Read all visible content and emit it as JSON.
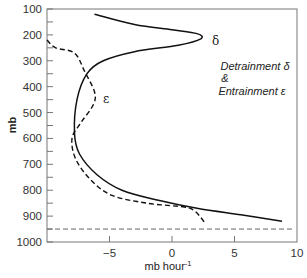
{
  "chart_data": {
    "type": "line",
    "title": "",
    "xlabel": "mb hour",
    "xlabel_superscript": "-1",
    "ylabel": "mb",
    "xlim": [
      -10,
      10
    ],
    "ylim": [
      1000,
      100
    ],
    "y_inverted": true,
    "xticks": [
      -5,
      0,
      5,
      10
    ],
    "xtick_labels": [
      "−5",
      "0",
      "5",
      "10"
    ],
    "yticks": [
      100,
      200,
      300,
      400,
      500,
      600,
      700,
      800,
      900,
      1000
    ],
    "ytick_labels": [
      "100",
      "200",
      "300",
      "400",
      "500",
      "600",
      "700",
      "800",
      "900",
      "1000"
    ],
    "grid": false,
    "annotation": {
      "line1": "Detrainment δ",
      "line2": "&",
      "line3": "Entrainment ε"
    },
    "reference_line": {
      "pressure": 950,
      "style": "dashed",
      "label": ""
    },
    "series": [
      {
        "name": "δ",
        "label": "Detrainment δ",
        "style": "solid",
        "points": [
          {
            "x": -6.2,
            "p": 120
          },
          {
            "x": -3.0,
            "p": 160
          },
          {
            "x": 0.0,
            "p": 180
          },
          {
            "x": 2.0,
            "p": 195
          },
          {
            "x": 2.3,
            "p": 215
          },
          {
            "x": 0.5,
            "p": 240
          },
          {
            "x": -3.0,
            "p": 265
          },
          {
            "x": -5.5,
            "p": 300
          },
          {
            "x": -6.8,
            "p": 350
          },
          {
            "x": -7.6,
            "p": 450
          },
          {
            "x": -7.8,
            "p": 580
          },
          {
            "x": -7.4,
            "p": 660
          },
          {
            "x": -6.0,
            "p": 740
          },
          {
            "x": -4.0,
            "p": 800
          },
          {
            "x": -1.0,
            "p": 840
          },
          {
            "x": 2.0,
            "p": 870
          },
          {
            "x": 5.5,
            "p": 895
          },
          {
            "x": 8.8,
            "p": 920
          }
        ]
      },
      {
        "name": "ε",
        "label": "Entrainment ε",
        "style": "dashed",
        "points": [
          {
            "x": -10.0,
            "p": 220
          },
          {
            "x": -9.3,
            "p": 250
          },
          {
            "x": -7.8,
            "p": 270
          },
          {
            "x": -7.0,
            "p": 340
          },
          {
            "x": -6.2,
            "p": 420
          },
          {
            "x": -6.3,
            "p": 470
          },
          {
            "x": -7.3,
            "p": 540
          },
          {
            "x": -8.0,
            "p": 600
          },
          {
            "x": -7.7,
            "p": 680
          },
          {
            "x": -6.5,
            "p": 760
          },
          {
            "x": -4.8,
            "p": 820
          },
          {
            "x": -2.0,
            "p": 850
          },
          {
            "x": 1.0,
            "p": 865
          },
          {
            "x": 1.8,
            "p": 880
          },
          {
            "x": 2.3,
            "p": 905
          },
          {
            "x": 2.6,
            "p": 925
          }
        ]
      }
    ]
  }
}
